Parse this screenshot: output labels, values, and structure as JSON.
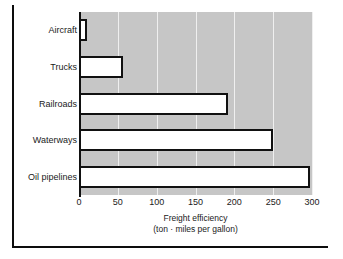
{
  "chart_data": {
    "type": "bar",
    "orientation": "horizontal",
    "title": "",
    "xlabel": "Freight efficiency",
    "xlabel_sub": "(ton · miles per gallon)",
    "ylabel": "",
    "categories": [
      "Aircraft",
      "Trucks",
      "Railroads",
      "Waterways",
      "Oil pipelines"
    ],
    "values": [
      10,
      57,
      192,
      250,
      297
    ],
    "xlim": [
      0,
      300
    ],
    "xticks": [
      0,
      50,
      100,
      150,
      200,
      250,
      300
    ],
    "xtick_labels": [
      "0",
      "50",
      "100",
      "150",
      "200",
      "250",
      "300"
    ],
    "grid": "vertical-only",
    "legend": "none",
    "colors": {
      "plot_background": "#c6c6c6",
      "gridline": "#efefef",
      "bar_fill": "#ffffff",
      "bar_edge": "#111111",
      "axis": "#111111",
      "text": "#1a1a1a",
      "page_background": "#ffffff"
    }
  }
}
